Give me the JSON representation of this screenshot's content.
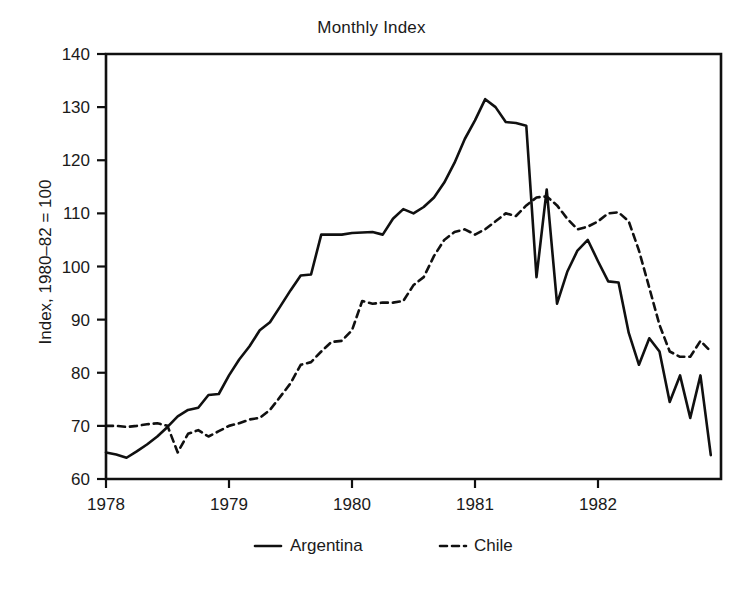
{
  "chart_data": {
    "type": "line",
    "title": "Monthly Index",
    "xlabel": "",
    "ylabel": "Index, 1980–82 = 100",
    "xlim": [
      1978.0,
      1983.0
    ],
    "ylim": [
      60,
      140
    ],
    "ytick_labels": [
      "60",
      "70",
      "80",
      "90",
      "100",
      "110",
      "120",
      "130",
      "140"
    ],
    "ytick_values": [
      60,
      70,
      80,
      90,
      100,
      110,
      120,
      130,
      140
    ],
    "xtick_labels": [
      "1978",
      "1979",
      "1980",
      "1981",
      "1982"
    ],
    "xtick_values": [
      1978,
      1979,
      1980,
      1981,
      1982
    ],
    "grid": false,
    "legend_position": "below-center",
    "x": [
      1978.0,
      1978.083,
      1978.167,
      1978.25,
      1978.333,
      1978.417,
      1978.5,
      1978.583,
      1978.667,
      1978.75,
      1978.833,
      1978.917,
      1979.0,
      1979.083,
      1979.167,
      1979.25,
      1979.333,
      1979.417,
      1979.5,
      1979.583,
      1979.667,
      1979.75,
      1979.833,
      1979.917,
      1980.0,
      1980.083,
      1980.167,
      1980.25,
      1980.333,
      1980.417,
      1980.5,
      1980.583,
      1980.667,
      1980.75,
      1980.833,
      1980.917,
      1981.0,
      1981.083,
      1981.167,
      1981.25,
      1981.333,
      1981.417,
      1981.5,
      1981.583,
      1981.667,
      1981.75,
      1981.833,
      1981.917,
      1982.0,
      1982.083,
      1982.167,
      1982.25,
      1982.333,
      1982.417,
      1982.5,
      1982.583,
      1982.667,
      1982.75,
      1982.833,
      1982.917
    ],
    "series": [
      {
        "name": "Argentina",
        "style": "solid",
        "color": "#101010",
        "values": [
          65.0,
          64.6,
          64.0,
          65.2,
          66.5,
          68.0,
          69.8,
          71.8,
          73.0,
          73.4,
          75.8,
          76.0,
          79.5,
          82.5,
          85.0,
          88.0,
          89.5,
          92.5,
          95.5,
          98.3,
          98.5,
          106.0,
          106.0,
          106.0,
          106.3,
          106.4,
          106.5,
          106.0,
          109.0,
          110.8,
          110.0,
          111.2,
          113.0,
          115.8,
          119.5,
          124.0,
          127.5,
          131.5,
          130.0,
          127.2,
          127.0,
          126.5,
          98.0,
          114.5,
          93.0,
          99.0,
          103.0,
          105.0,
          101.0,
          97.2,
          97.0,
          87.5,
          81.5,
          86.5,
          84.0,
          74.5,
          79.5,
          71.5,
          79.5,
          64.5
        ]
      },
      {
        "name": "Chile",
        "style": "dashed",
        "color": "#101010",
        "values": [
          70.0,
          70.0,
          69.8,
          70.0,
          70.3,
          70.5,
          70.0,
          65.0,
          68.5,
          69.2,
          68.0,
          69.0,
          70.0,
          70.5,
          71.2,
          71.5,
          73.0,
          75.5,
          78.0,
          81.5,
          82.0,
          84.0,
          85.8,
          86.0,
          88.0,
          93.5,
          93.0,
          93.2,
          93.2,
          93.5,
          96.5,
          98.0,
          102.0,
          105.0,
          106.5,
          107.0,
          106.0,
          107.0,
          108.5,
          110.0,
          109.5,
          111.5,
          113.0,
          113.2,
          111.5,
          109.0,
          107.0,
          107.5,
          108.5,
          110.0,
          110.2,
          108.5,
          103.0,
          96.0,
          89.0,
          84.0,
          83.0,
          83.0,
          86.0,
          84.0
        ]
      }
    ]
  },
  "legend": {
    "items": [
      {
        "label": "Argentina",
        "style": "solid"
      },
      {
        "label": "Chile",
        "style": "dashed"
      }
    ]
  },
  "axes": {
    "y_title": "Index, 1980–82 = 100",
    "title": "Monthly Index"
  }
}
